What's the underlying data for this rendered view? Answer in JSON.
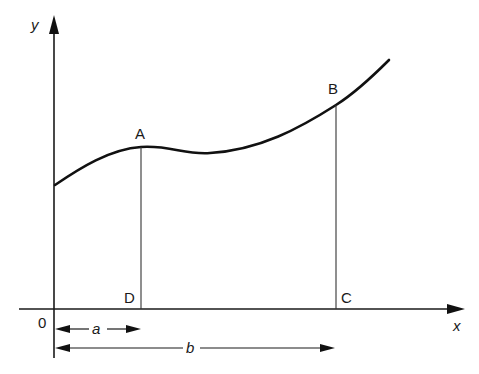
{
  "diagram": {
    "type": "area-under-curve",
    "axes": {
      "x_label": "x",
      "y_label": "y",
      "origin_label": "0"
    },
    "points": {
      "A": "A",
      "B": "B",
      "C": "C",
      "D": "D"
    },
    "dimensions": {
      "a_label": "a",
      "b_label": "b"
    },
    "colors": {
      "ink": "#111111",
      "background": "#ffffff"
    }
  }
}
